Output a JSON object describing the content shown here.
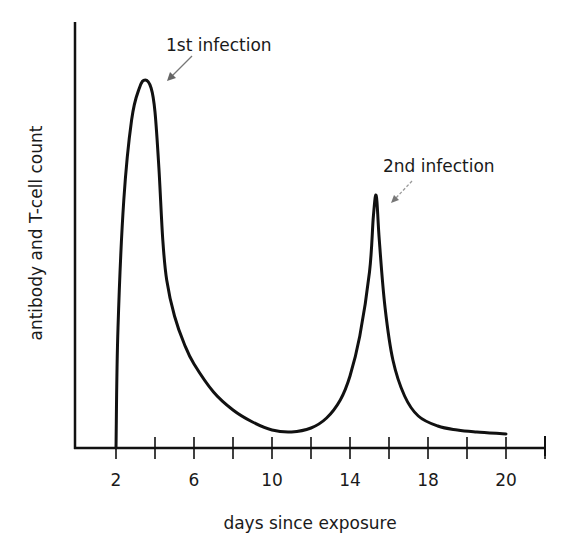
{
  "chart_data": {
    "type": "line",
    "title": "",
    "xlabel": "days since exposure",
    "ylabel": "antibody and T-cell count",
    "x_tick_labels": [
      {
        "label": "2",
        "tick_index": 0
      },
      {
        "label": "6",
        "tick_index": 2
      },
      {
        "label": "10",
        "tick_index": 4
      },
      {
        "label": "14",
        "tick_index": 6
      },
      {
        "label": "18",
        "tick_index": 8
      },
      {
        "label": "20",
        "tick_index": 10
      }
    ],
    "tick_count": 12,
    "xlim": [
      0,
      24
    ],
    "ylim": [
      0,
      100
    ],
    "grid": false,
    "legend": null,
    "series": [
      {
        "name": "antibody and T-cell count",
        "x": [
          2.0,
          2.1,
          2.4,
          2.8,
          3.2,
          3.5,
          3.8,
          4.0,
          4.2,
          4.4,
          4.6,
          5.0,
          5.5,
          6.0,
          7.0,
          8.0,
          9.0,
          10.0,
          11.0,
          12.0,
          12.8,
          13.5,
          14.0,
          14.5,
          15.0,
          15.2,
          15.35,
          15.5,
          15.8,
          16.2,
          16.8,
          17.5,
          18.5,
          19.5,
          20.5,
          22.0
        ],
        "y": [
          0,
          30,
          62,
          82,
          90,
          92,
          90,
          84,
          70,
          52,
          42,
          33,
          26,
          21,
          14,
          9.5,
          6.5,
          4.5,
          4,
          5,
          7.5,
          12,
          18,
          28,
          44,
          58,
          63,
          52,
          35,
          22,
          13,
          8,
          5.5,
          4.5,
          4,
          3.5
        ]
      }
    ],
    "annotations": [
      {
        "text": "1st infection",
        "points_to_x": 3.5,
        "points_to_y": 92
      },
      {
        "text": "2nd infection",
        "points_to_x": 15.35,
        "points_to_y": 63
      }
    ]
  },
  "labels": {
    "xlabel": "days since exposure",
    "ylabel": "antibody and T-cell count",
    "annotation_1": "1st infection",
    "annotation_2": "2nd infection",
    "ticks": [
      "2",
      "6",
      "10",
      "14",
      "18",
      "20"
    ]
  }
}
